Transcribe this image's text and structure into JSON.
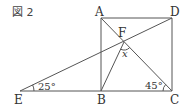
{
  "figure": {
    "title": "図 2",
    "points": {
      "A": "A",
      "B": "B",
      "C": "C",
      "D": "D",
      "E": "E",
      "F": "F"
    },
    "angles": {
      "E": "25°",
      "C": "45°",
      "x": "x"
    },
    "colors": {
      "line": "#555555",
      "text": "#333333",
      "background": "#ffffff"
    }
  }
}
